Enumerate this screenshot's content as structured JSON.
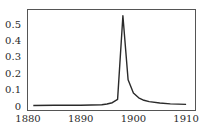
{
  "chart_data": {
    "type": "line",
    "title": "",
    "xlabel": "",
    "ylabel": "",
    "xlim": [
      1880,
      1911
    ],
    "ylim": [
      0,
      0.58
    ],
    "grid": false,
    "legend": null,
    "x_ticks": [
      1880,
      1890,
      1900,
      1910
    ],
    "x_tick_labels": [
      "1880",
      "1890",
      "1900",
      "1910"
    ],
    "y_ticks": [
      0,
      0.1,
      0.2,
      0.3,
      0.4,
      0.5
    ],
    "y_tick_labels": [
      "0",
      "0.1",
      "0.2",
      "0.3",
      "0.4",
      "0.5"
    ],
    "series": [
      {
        "name": "series-1",
        "color": "#2a2a2a",
        "x": [
          1881,
          1885,
          1890,
          1894,
          1895,
          1896,
          1897,
          1898,
          1899,
          1900,
          1901,
          1902,
          1903,
          1905,
          1907,
          1910
        ],
        "values": [
          0.003,
          0.004,
          0.005,
          0.008,
          0.012,
          0.02,
          0.04,
          0.55,
          0.16,
          0.08,
          0.05,
          0.035,
          0.027,
          0.018,
          0.013,
          0.01
        ]
      }
    ]
  }
}
